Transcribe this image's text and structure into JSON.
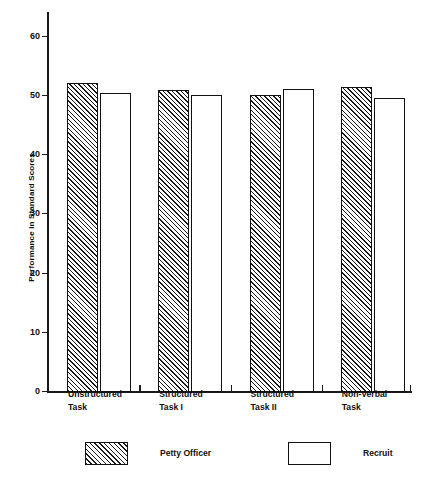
{
  "chart_data": {
    "type": "bar",
    "title": "",
    "subtitle": "",
    "xlabel": "",
    "ylabel": "Performance in Standard Scores",
    "categories": [
      "Unstructured Task",
      "Structured Task I",
      "Structured Task II",
      "Non-Verbal Task"
    ],
    "category_lines": [
      [
        "Unstructured",
        "Task"
      ],
      [
        "Structured",
        "Task I"
      ],
      [
        "Structured",
        "Task II"
      ],
      [
        "Non-Verbal",
        "Task"
      ]
    ],
    "series": [
      {
        "name": "Petty Officer",
        "fill": "diagonal-hatch",
        "values": [
          52.0,
          50.9,
          50.0,
          51.4
        ]
      },
      {
        "name": "Recruit",
        "fill": "none",
        "values": [
          50.4,
          49.9,
          51.0,
          49.5
        ]
      }
    ],
    "ylim": [
      0,
      64
    ],
    "yticks": [
      0,
      10,
      20,
      30,
      40,
      50,
      60
    ],
    "ytick_labels": [
      "0",
      "10",
      "20",
      "30",
      "40",
      "50",
      "60"
    ],
    "grid": false,
    "legend_position": "bottom-left",
    "colors": {
      "axis": "#1a1a1a",
      "bar_outline": "#111111",
      "hatch": "#1a1a1a",
      "background": "#ffffff"
    }
  },
  "legend": {
    "items": [
      {
        "label": "Petty Officer",
        "fill": "diagonal-hatch"
      },
      {
        "label": "Recruit",
        "fill": "none"
      }
    ]
  }
}
